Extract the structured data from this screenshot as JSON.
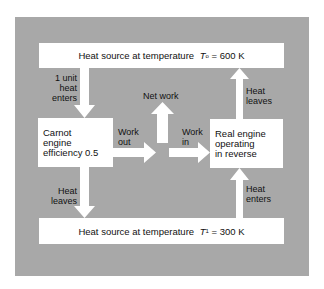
{
  "diagram": {
    "top_box": {
      "prefix": "Heat source at temperature ",
      "symbol": "T",
      "subscript": "o",
      "suffix": " = 600 K"
    },
    "bottom_box": {
      "prefix": "Heat source at temperature ",
      "symbol": "T",
      "subscript": "1",
      "suffix": " = 300 K"
    },
    "carnot_box": {
      "lines": [
        "Carnot",
        "engine",
        "efficiency 0.5"
      ]
    },
    "real_box": {
      "lines": [
        "Real engine",
        "operating",
        "in reverse"
      ]
    },
    "labels": {
      "heat_enters_carnot": [
        "1 unit",
        "heat",
        "enters"
      ],
      "heat_leaves_carnot": [
        "Heat",
        "leaves"
      ],
      "net_work": "Net work",
      "work_out": [
        "Work",
        "out"
      ],
      "work_in": [
        "Work",
        "in"
      ],
      "heat_leaves_real": [
        "Heat",
        "leaves"
      ],
      "heat_enters_real": [
        "Heat",
        "enters"
      ]
    },
    "colors": {
      "panel": "#a8a8a8",
      "boxes": "#ffffff",
      "arrows": "#ffffff",
      "text": "#111111"
    }
  }
}
